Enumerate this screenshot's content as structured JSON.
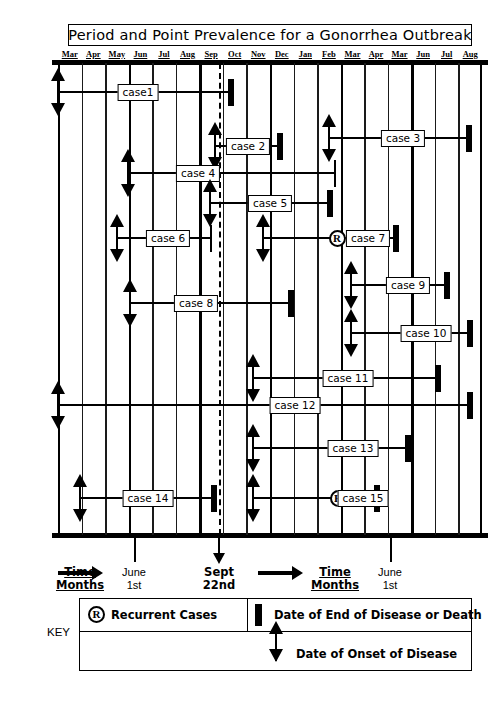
{
  "title": "Period and Point Prevalence for a Gonorrhea Outbreak",
  "months": [
    "Mar",
    "Apr",
    "May",
    "Jun",
    "Jul",
    "Aug",
    "Sep",
    "Oct",
    "Nov",
    "Dec",
    "Jan",
    "Feb",
    "Mar",
    "Apr",
    "Mar",
    "Jun",
    "Jul",
    "Aug"
  ],
  "annotations": {
    "time_months_1": "Time",
    "time_months_1b": "Months",
    "june_1st_a": "June",
    "june_1st_a2": "1st",
    "sept_a": "Sept",
    "sept_b": "22nd",
    "time_months_2": "Time",
    "time_months_2b": "Months",
    "june_1st_b": "June",
    "june_1st_b2": "1st"
  },
  "key": {
    "label": "KEY",
    "recurrent_symbol": "R",
    "recurrent_text": "Recurrent Cases",
    "end_text": "Date of End of Disease or Death",
    "onset_text": "Date of Onset of Disease"
  },
  "chart_data": {
    "type": "bar",
    "title": "Period and Point Prevalence for a Gonorrhea Outbreak",
    "xlabel": "Time Months",
    "ylabel": "",
    "grid": true,
    "legend_position": "bottom",
    "axis_months": [
      "Mar",
      "Apr",
      "May",
      "Jun",
      "Jul",
      "Aug",
      "Sep",
      "Oct",
      "Nov",
      "Dec",
      "Jan",
      "Feb",
      "Mar",
      "Apr",
      "Mar",
      "Jun",
      "Jul",
      "Aug"
    ],
    "point_prevalence_date": "Sept 22nd",
    "period_boundaries": [
      "June 1st",
      "June 1st"
    ],
    "cases": [
      {
        "label": "case1",
        "onset": true,
        "onset_x": 0,
        "end_x": 173,
        "end_style": "block",
        "recurrent": false,
        "label_x": 80
      },
      {
        "label": "case 2",
        "onset": true,
        "onset_x": 157,
        "end_x": 222,
        "end_style": "block",
        "recurrent": false,
        "label_x": 190
      },
      {
        "label": "case 3",
        "onset": true,
        "onset_x": 271,
        "end_x": 411,
        "end_style": "block",
        "recurrent": false,
        "label_x": 345
      },
      {
        "label": "case 4",
        "onset": true,
        "onset_x": 70,
        "end_x": 277,
        "end_style": "cap",
        "recurrent": false,
        "label_x": 140
      },
      {
        "label": "case 5",
        "onset": true,
        "onset_x": 152,
        "end_x": 272,
        "end_style": "block",
        "recurrent": false,
        "label_x": 212
      },
      {
        "label": "case 6",
        "onset": true,
        "onset_x": 59,
        "end_x": 153,
        "end_style": "cap",
        "recurrent": false,
        "label_x": 110
      },
      {
        "label": "case 7",
        "onset": true,
        "onset_x": 205,
        "end_x": 338,
        "end_style": "block",
        "recurrent": true,
        "recurrent_x": 279,
        "label_x": 310
      },
      {
        "label": "case 8",
        "onset": true,
        "onset_x": 72,
        "end_x": 233,
        "end_style": "block",
        "recurrent": false,
        "label_x": 138
      },
      {
        "label": "case 9",
        "onset": true,
        "onset_x": 293,
        "end_x": 389,
        "end_style": "block",
        "recurrent": false,
        "label_x": 350
      },
      {
        "label": "case 10",
        "onset": true,
        "onset_x": 293,
        "end_x": 412,
        "end_style": "block",
        "recurrent": false,
        "label_x": 368
      },
      {
        "label": "case 11",
        "onset": true,
        "onset_x": 195,
        "end_x": 380,
        "end_style": "block",
        "recurrent": false,
        "label_x": 290
      },
      {
        "label": "case 12",
        "onset": true,
        "onset_x": 0,
        "end_x": 412,
        "end_style": "block",
        "recurrent": false,
        "label_x": 237
      },
      {
        "label": "case 13",
        "onset": true,
        "onset_x": 195,
        "end_x": 350,
        "end_style": "block",
        "recurrent": false,
        "label_x": 295
      },
      {
        "label": "case 14",
        "onset": true,
        "onset_x": 22,
        "end_x": 156,
        "end_style": "block",
        "recurrent": false,
        "label_x": 90
      },
      {
        "label": "case 15",
        "onset": true,
        "onset_x": 195,
        "end_x": 319,
        "end_style": "block",
        "recurrent": true,
        "recurrent_x": 280,
        "label_x": 305
      }
    ],
    "row_y": [
      29,
      83,
      75,
      110,
      140,
      175,
      175,
      240,
      222,
      270,
      315,
      342,
      385,
      435,
      435
    ]
  }
}
